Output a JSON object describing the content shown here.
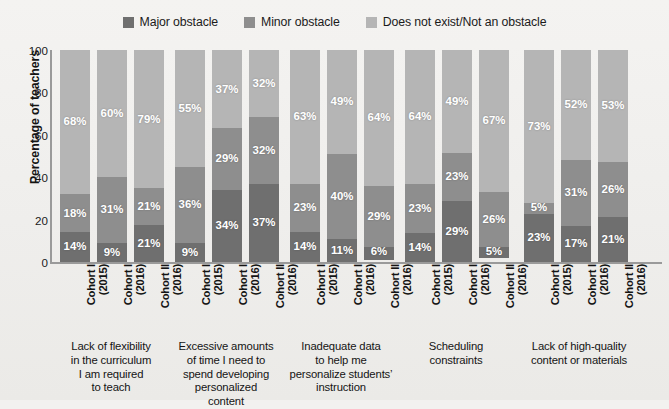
{
  "chart_data": {
    "type": "bar",
    "subtype": "stacked-bar-100-percent",
    "title": "",
    "xlabel": "",
    "ylabel": "Percentage of teachers",
    "ylim": [
      0,
      100
    ],
    "yticks": [
      0,
      20,
      40,
      60,
      80,
      100
    ],
    "grid": false,
    "legend_position": "top-center",
    "legend": [
      {
        "name": "Major obstacle",
        "color": "#6f6f6f"
      },
      {
        "name": "Minor obstacle",
        "color": "#8e8e8e"
      },
      {
        "name": "Does not exist/Not an obstacle",
        "color": "#b5b5b5"
      }
    ],
    "series": [
      {
        "name": "Major obstacle",
        "color": "#6f6f6f",
        "values": [
          14,
          9,
          21,
          9,
          34,
          37,
          14,
          11,
          6,
          14,
          29,
          5,
          23,
          17,
          21
        ]
      },
      {
        "name": "Minor obstacle",
        "color": "#8e8e8e",
        "values": [
          18,
          31,
          21,
          36,
          29,
          32,
          23,
          40,
          29,
          23,
          23,
          26,
          5,
          31,
          26
        ]
      },
      {
        "name": "Does not exist/Not an obstacle",
        "color": "#b5b5b5",
        "values": [
          68,
          60,
          79,
          55,
          37,
          32,
          63,
          49,
          64,
          64,
          49,
          67,
          73,
          52,
          53
        ]
      }
    ],
    "categories": [
      "Cohort I (2015)",
      "Cohort I (2016)",
      "Cohort II (2016)",
      "Cohort I (2015)",
      "Cohort I (2016)",
      "Cohort II (2016)",
      "Cohort I (2015)",
      "Cohort I (2016)",
      "Cohort II (2016)",
      "Cohort I (2015)",
      "Cohort I (2016)",
      "Cohort II (2016)",
      "Cohort I (2015)",
      "Cohort I (2016)",
      "Cohort II (2016)"
    ],
    "groups": [
      {
        "caption": "Lack of flexibility in the curriculum I am required to teach",
        "caption_lines": [
          "Lack of flexibility",
          "in the curriculum",
          "I am required",
          "to teach"
        ],
        "bars": [
          {
            "cohort_line1": "Cohort I",
            "cohort_line2": "(2015)",
            "major": 14,
            "minor": 18,
            "none": 68
          },
          {
            "cohort_line1": "Cohort I",
            "cohort_line2": "(2016)",
            "major": 9,
            "minor": 31,
            "none": 60
          },
          {
            "cohort_line1": "Cohort II",
            "cohort_line2": "(2016)",
            "major": 21,
            "minor": 21,
            "none": 79
          }
        ]
      },
      {
        "caption": "Excessive amounts of time I need to spend developing personalized content",
        "caption_lines": [
          "Excessive amounts",
          "of time I need to",
          "spend developing",
          "personalized",
          "content"
        ],
        "bars": [
          {
            "cohort_line1": "Cohort I",
            "cohort_line2": "(2015)",
            "major": 9,
            "minor": 36,
            "none": 55
          },
          {
            "cohort_line1": "Cohort I",
            "cohort_line2": "(2016)",
            "major": 34,
            "minor": 29,
            "none": 37
          },
          {
            "cohort_line1": "Cohort II",
            "cohort_line2": "(2016)",
            "major": 37,
            "minor": 32,
            "none": 32
          }
        ]
      },
      {
        "caption": "Inadequate data to help me personalize students' instruction",
        "caption_lines": [
          "Inadequate data",
          "to help me",
          "personalize students’",
          "instruction"
        ],
        "bars": [
          {
            "cohort_line1": "Cohort I",
            "cohort_line2": "(2015)",
            "major": 14,
            "minor": 23,
            "none": 63
          },
          {
            "cohort_line1": "Cohort I",
            "cohort_line2": "(2016)",
            "major": 11,
            "minor": 40,
            "none": 49
          },
          {
            "cohort_line1": "Cohort II",
            "cohort_line2": "(2016)",
            "major": 6,
            "minor": 29,
            "none": 64
          }
        ]
      },
      {
        "caption": "Scheduling constraints",
        "caption_lines": [
          "Scheduling",
          "constraints"
        ],
        "bars": [
          {
            "cohort_line1": "Cohort I",
            "cohort_line2": "(2015)",
            "major": 14,
            "minor": 23,
            "none": 64
          },
          {
            "cohort_line1": "Cohort I",
            "cohort_line2": "(2016)",
            "major": 29,
            "minor": 23,
            "none": 49
          },
          {
            "cohort_line1": "Cohort II",
            "cohort_line2": "(2016)",
            "major": 5,
            "minor": 26,
            "none": 67
          }
        ]
      },
      {
        "caption": "Lack of high-quality content or materials",
        "caption_lines": [
          "Lack of high-quality",
          "content or materials"
        ],
        "bars": [
          {
            "cohort_line1": "Cohort I",
            "cohort_line2": "(2015)",
            "major": 23,
            "minor": 5,
            "none": 73
          },
          {
            "cohort_line1": "Cohort I",
            "cohort_line2": "(2016)",
            "major": 17,
            "minor": 31,
            "none": 52
          },
          {
            "cohort_line1": "Cohort II",
            "cohort_line2": "(2016)",
            "major": 21,
            "minor": 26,
            "none": 53
          }
        ]
      }
    ]
  }
}
